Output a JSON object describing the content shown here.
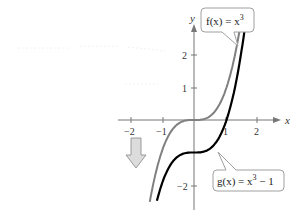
{
  "chart_data": {
    "type": "line",
    "title": "",
    "xlabel": "x",
    "ylabel": "y",
    "xlim": [
      -2.5,
      2.6
    ],
    "ylim": [
      -2.5,
      3.2
    ],
    "x_ticks": [
      -2,
      -1,
      1,
      2
    ],
    "x_tick_labels": [
      "−2",
      "−1",
      "1",
      "2"
    ],
    "y_ticks": [
      -2,
      1,
      2
    ],
    "y_tick_labels": [
      "−2",
      "1",
      "2"
    ],
    "grid": false,
    "series": [
      {
        "name": "f(x) = x^3",
        "label": "f(x) = x³",
        "color": "#808080",
        "x": [
          -1.36,
          -1.2,
          -1.0,
          -0.8,
          -0.5,
          0,
          0.5,
          0.8,
          1.0,
          1.2,
          1.46
        ],
        "values": [
          -2.5,
          -1.73,
          -1.0,
          -0.51,
          -0.13,
          0,
          0.13,
          0.51,
          1.0,
          1.73,
          3.1
        ]
      },
      {
        "name": "g(x) = x^3 - 1",
        "label": "g(x) = x³ − 1",
        "color": "#000000",
        "x": [
          -1.14,
          -1.0,
          -0.8,
          -0.5,
          0,
          0.5,
          0.8,
          1.0,
          1.2,
          1.4,
          1.6
        ],
        "values": [
          -2.5,
          -2.0,
          -1.51,
          -1.13,
          -1.0,
          -0.88,
          -0.49,
          0,
          0.73,
          1.74,
          3.1
        ]
      }
    ],
    "annotations": [
      {
        "type": "arrow",
        "direction": "down",
        "meaning": "vertical shift down 1 unit",
        "position": [
          -1.9,
          -0.9
        ]
      }
    ]
  },
  "labels": {
    "x_axis": "x",
    "y_axis": "y",
    "f_label": {
      "prefix": "f(x) = x",
      "sup": "3",
      "suffix": ""
    },
    "g_label": {
      "prefix": "g(x) = x",
      "sup": "3",
      "suffix": " − 1"
    },
    "tick_x": [
      "−2",
      "−1",
      "1",
      "2"
    ],
    "tick_y": [
      "2",
      "1",
      "−2"
    ]
  }
}
